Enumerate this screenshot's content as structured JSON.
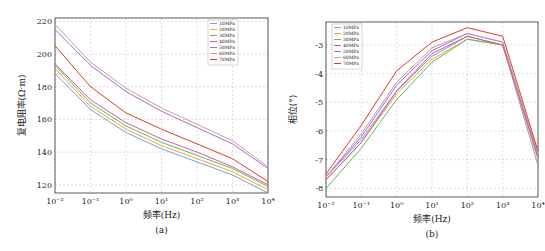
{
  "chart_data": [
    {
      "type": "line",
      "panel": "(a)",
      "title": "",
      "xlabel": "频率(Hz)",
      "ylabel": "复电阻率(Ω·m)",
      "xscale": "log",
      "xlim": [
        0.01,
        10000
      ],
      "ylim": [
        115,
        222
      ],
      "x_ticks": [
        "10⁻²",
        "10⁻¹",
        "10⁰",
        "10¹",
        "10²",
        "10³",
        "10⁴"
      ],
      "y_ticks": [
        120,
        140,
        160,
        180,
        200,
        220
      ],
      "grid": true,
      "legend_position": "upper right",
      "x": [
        0.01,
        0.1,
        1,
        10,
        100,
        1000,
        10000
      ],
      "series": [
        {
          "name": "10MPa",
          "color": "#7b9fd6",
          "values": [
            188,
            166,
            152,
            142,
            134,
            126,
            115
          ]
        },
        {
          "name": "20MPa",
          "color": "#f0a23a",
          "values": [
            191,
            168,
            154,
            144,
            136,
            128,
            117
          ]
        },
        {
          "name": "30MPa",
          "color": "#5fb85f",
          "values": [
            193,
            170,
            156,
            146,
            138,
            130,
            119
          ]
        },
        {
          "name": "40MPa",
          "color": "#d05a9a",
          "values": [
            194,
            172,
            158,
            148,
            140,
            131,
            120
          ]
        },
        {
          "name": "50MPa",
          "color": "#a070c8",
          "values": [
            215,
            193,
            177,
            165,
            155,
            145,
            130
          ]
        },
        {
          "name": "60MPa",
          "color": "#c89aa8",
          "values": [
            218,
            195,
            179,
            167,
            157,
            147,
            131
          ]
        },
        {
          "name": "70MPa",
          "color": "#e03a2a",
          "values": [
            205,
            180,
            164,
            154,
            145,
            136,
            122
          ]
        }
      ]
    },
    {
      "type": "line",
      "panel": "(b)",
      "title": "",
      "xlabel": "频率(Hz)",
      "ylabel": "相位(°)",
      "xscale": "log",
      "xlim": [
        0.01,
        10000
      ],
      "ylim": [
        -8.3,
        -2.2
      ],
      "x_ticks": [
        "10⁻²",
        "10⁻¹",
        "10⁰",
        "10¹",
        "10²",
        "10³",
        "10⁴"
      ],
      "y_ticks": [
        -8,
        -7,
        -6,
        -5,
        -4,
        -3
      ],
      "grid": true,
      "legend_position": "upper left",
      "x": [
        0.01,
        0.1,
        1,
        10,
        100,
        1000,
        10000
      ],
      "series": [
        {
          "name": "10MPa",
          "color": "#7b9fd6",
          "values": [
            -7.6,
            -6.3,
            -4.6,
            -3.4,
            -2.7,
            -3.0,
            -7.2
          ]
        },
        {
          "name": "20MPa",
          "color": "#f0a23a",
          "values": [
            -7.7,
            -6.4,
            -4.7,
            -3.5,
            -2.8,
            -3.0,
            -7.0
          ]
        },
        {
          "name": "30MPa",
          "color": "#5fb85f",
          "values": [
            -8.0,
            -6.6,
            -4.9,
            -3.6,
            -2.8,
            -3.0,
            -6.8
          ]
        },
        {
          "name": "40MPa",
          "color": "#d05a9a",
          "values": [
            -7.7,
            -6.4,
            -4.6,
            -3.3,
            -2.7,
            -3.0,
            -6.9
          ]
        },
        {
          "name": "50MPa",
          "color": "#a070c8",
          "values": [
            -7.6,
            -6.2,
            -4.4,
            -3.2,
            -2.6,
            -2.9,
            -6.9
          ]
        },
        {
          "name": "60MPa",
          "color": "#c89aa8",
          "values": [
            -7.6,
            -6.1,
            -4.3,
            -3.1,
            -2.6,
            -2.9,
            -6.8
          ]
        },
        {
          "name": "70MPa",
          "color": "#e03a2a",
          "values": [
            -7.5,
            -5.8,
            -3.9,
            -2.9,
            -2.4,
            -2.7,
            -6.7
          ]
        }
      ]
    }
  ],
  "captions": {
    "a": "(a)",
    "b": "(b)"
  }
}
